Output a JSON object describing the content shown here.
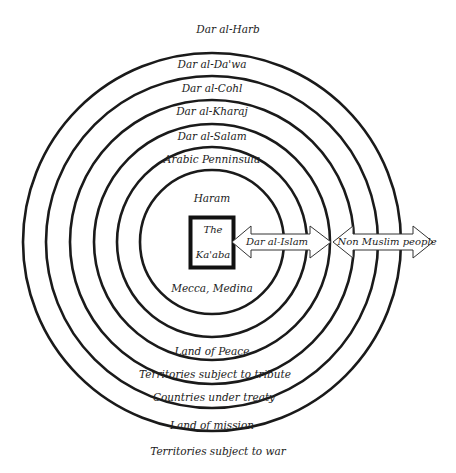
{
  "diagram": {
    "center": {
      "x": 212,
      "y": 242
    },
    "rings": [
      {
        "r": 189,
        "top_label": "Dar al-Da'wa",
        "bottom_label": "Land of mission"
      },
      {
        "r": 166,
        "top_label": "Dar al-Cohl",
        "bottom_label": "Countries under treaty"
      },
      {
        "r": 142,
        "top_label": "Dar al-Kharaj",
        "bottom_label": "Territories subject to tribute"
      },
      {
        "r": 118,
        "top_label": "Dar al-Salam",
        "bottom_label": "Land of Peace"
      },
      {
        "r": 95,
        "top_label": "Arabic Penninsula",
        "bottom_label": ""
      },
      {
        "r": 72,
        "top_label": "Haram",
        "bottom_label": "Mecca, Medina"
      }
    ],
    "outer_top_label": "Dar al-Harb",
    "outer_bottom_label": "Territories subject to war",
    "center_box": {
      "line1": "The",
      "line2": "Ka'aba"
    },
    "arrows": [
      {
        "label": "Dar al-Islam"
      },
      {
        "label": "Non Muslim people"
      }
    ],
    "stroke_color": "#1a1a1a"
  },
  "labels": {
    "dar_al_harb": "Dar al-Harb",
    "dar_al_dawa": "Dar al-Da'wa",
    "dar_al_cohl": "Dar al-Cohl",
    "dar_al_kharaj": "Dar al-Kharaj",
    "dar_al_salam": "Dar al-Salam",
    "arabic_peninsula": "Arabic Penninsula",
    "haram": "Haram",
    "kaaba_line1": "The",
    "kaaba_line2": "Ka'aba",
    "dar_al_islam": "Dar al-Islam",
    "non_muslim_people": "Non Muslim people",
    "mecca_medina": "Mecca, Medina",
    "land_of_peace": "Land of Peace",
    "territories_tribute": "Territories subject to tribute",
    "countries_treaty": "Countries under treaty",
    "land_of_mission": "Land of mission",
    "territories_war": "Territories subject to war"
  }
}
